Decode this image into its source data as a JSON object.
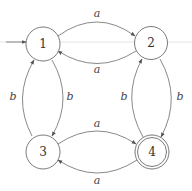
{
  "diagram": {
    "type": "finite-automaton",
    "states": [
      {
        "id": "1",
        "label": "1",
        "initial": true,
        "accepting": false
      },
      {
        "id": "2",
        "label": "2",
        "initial": false,
        "accepting": false
      },
      {
        "id": "3",
        "label": "3",
        "initial": false,
        "accepting": false
      },
      {
        "id": "4",
        "label": "4",
        "initial": false,
        "accepting": true
      }
    ],
    "transitions": [
      {
        "from": "1",
        "to": "2",
        "label": "a"
      },
      {
        "from": "2",
        "to": "1",
        "label": "a"
      },
      {
        "from": "3",
        "to": "4",
        "label": "a"
      },
      {
        "from": "4",
        "to": "3",
        "label": "a"
      },
      {
        "from": "3",
        "to": "1",
        "label": "b"
      },
      {
        "from": "1",
        "to": "3",
        "label": "b"
      },
      {
        "from": "4",
        "to": "2",
        "label": "b"
      },
      {
        "from": "2",
        "to": "4",
        "label": "b"
      }
    ]
  }
}
